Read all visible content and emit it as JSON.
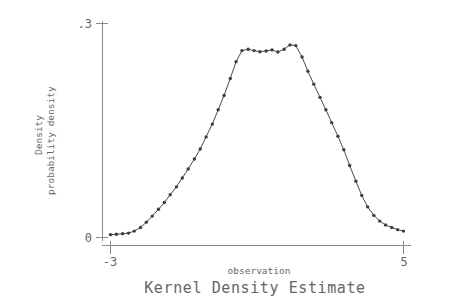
{
  "chart_data": {
    "type": "line",
    "title": "Kernel Density Estimate",
    "xlabel": "observation",
    "ylabel_lines": [
      "Density",
      "probability density"
    ],
    "xlim": [
      -3,
      5
    ],
    "ylim": [
      0,
      0.3
    ],
    "xticks": [
      -3,
      5
    ],
    "xtick_labels": [
      "-3",
      "5"
    ],
    "yticks": [
      0,
      0.3
    ],
    "ytick_labels": [
      "0",
      ".3"
    ],
    "grid": false,
    "legend": null,
    "markers": "filled-circle",
    "series": [
      {
        "name": "kdensity",
        "x": [
          -3.0,
          -2.84,
          -2.67,
          -2.51,
          -2.35,
          -2.18,
          -2.02,
          -1.86,
          -1.69,
          -1.53,
          -1.37,
          -1.2,
          -1.04,
          -0.88,
          -0.71,
          -0.55,
          -0.39,
          -0.22,
          -0.06,
          0.1,
          0.27,
          0.43,
          0.59,
          0.76,
          0.92,
          1.08,
          1.25,
          1.41,
          1.57,
          1.74,
          1.9,
          2.06,
          2.23,
          2.39,
          2.55,
          2.72,
          2.88,
          3.04,
          3.21,
          3.37,
          3.53,
          3.7,
          3.86,
          4.02,
          4.19,
          4.35,
          4.51,
          4.68,
          4.84,
          5.0
        ],
        "y": [
          0.004,
          0.0046,
          0.0052,
          0.0062,
          0.009,
          0.014,
          0.0215,
          0.03,
          0.0395,
          0.049,
          0.06,
          0.071,
          0.0835,
          0.096,
          0.11,
          0.124,
          0.141,
          0.159,
          0.179,
          0.199,
          0.223,
          0.2465,
          0.262,
          0.264,
          0.262,
          0.2605,
          0.2615,
          0.263,
          0.26,
          0.264,
          0.27,
          0.269,
          0.253,
          0.233,
          0.215,
          0.1965,
          0.179,
          0.161,
          0.142,
          0.123,
          0.101,
          0.079,
          0.059,
          0.043,
          0.031,
          0.023,
          0.0175,
          0.014,
          0.011,
          0.009
        ]
      }
    ]
  },
  "figure": {
    "title": "Kernel Density Estimate",
    "xaxis_title": "observation",
    "yaxis_title_line1": "Density",
    "yaxis_title_line2": "probability density",
    "x_tick_low": "-3",
    "x_tick_high": "5",
    "y_tick_low": "0",
    "y_tick_high": ".3",
    "colors": {
      "axis": "#8a8a8a",
      "curve": "#4a4a52",
      "marker": "#3d3d44",
      "text": "#666666",
      "background": "#ffffff"
    }
  }
}
